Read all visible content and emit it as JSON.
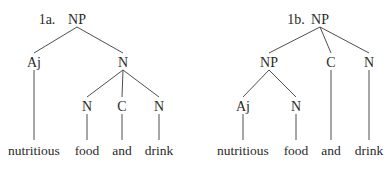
{
  "trees": [
    {
      "id": "1a",
      "label": "1a.",
      "nodes": [
        {
          "id": "root",
          "label": "NP",
          "type": "category"
        },
        {
          "id": "aj",
          "label": "Aj",
          "type": "category",
          "parent": "root"
        },
        {
          "id": "n",
          "label": "N",
          "type": "category",
          "parent": "root"
        },
        {
          "id": "n1",
          "label": "N",
          "type": "category",
          "parent": "n"
        },
        {
          "id": "c",
          "label": "C",
          "type": "category",
          "parent": "n"
        },
        {
          "id": "n2",
          "label": "N",
          "type": "category",
          "parent": "n"
        },
        {
          "id": "w1",
          "label": "nutritious",
          "type": "word",
          "parent": "aj"
        },
        {
          "id": "w2",
          "label": "food",
          "type": "word",
          "parent": "n1"
        },
        {
          "id": "w3",
          "label": "and",
          "type": "word",
          "parent": "c"
        },
        {
          "id": "w4",
          "label": "drink",
          "type": "word",
          "parent": "n2"
        }
      ]
    },
    {
      "id": "1b",
      "label": "1b.",
      "nodes": [
        {
          "id": "root",
          "label": "NP",
          "type": "category"
        },
        {
          "id": "np",
          "label": "NP",
          "type": "category",
          "parent": "root"
        },
        {
          "id": "c",
          "label": "C",
          "type": "category",
          "parent": "root"
        },
        {
          "id": "n",
          "label": "N",
          "type": "category",
          "parent": "root"
        },
        {
          "id": "aj",
          "label": "Aj",
          "type": "category",
          "parent": "np"
        },
        {
          "id": "n1",
          "label": "N",
          "type": "category",
          "parent": "np"
        },
        {
          "id": "w1",
          "label": "nutritious",
          "type": "word",
          "parent": "aj"
        },
        {
          "id": "w2",
          "label": "food",
          "type": "word",
          "parent": "n1"
        },
        {
          "id": "w3",
          "label": "and",
          "type": "word",
          "parent": "c"
        },
        {
          "id": "w4",
          "label": "drink",
          "type": "word",
          "parent": "n"
        }
      ]
    }
  ]
}
